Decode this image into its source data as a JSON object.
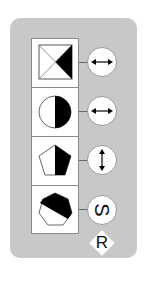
{
  "panel": {
    "background": "#c8c8c8",
    "rows": [
      {
        "shape": "square-with-diagonals",
        "shape_icon": "square-x-icon",
        "fill": "right-triangle-black",
        "control": "horizontal-double-arrow",
        "control_icon": "arrow-left-right-icon"
      },
      {
        "shape": "circle",
        "shape_icon": "half-circle-icon",
        "fill": "right-half-black",
        "control": "horizontal-double-arrow",
        "control_icon": "arrow-left-right-icon"
      },
      {
        "shape": "pentagon",
        "shape_icon": "pentagon-icon",
        "fill": "right-half-black",
        "control": "vertical-double-arrow",
        "control_icon": "arrow-up-down-icon"
      },
      {
        "shape": "heptagon",
        "shape_icon": "heptagon-icon",
        "fill": "upper-diagonal-black",
        "control": "rotated-letter",
        "control_label": "S"
      }
    ],
    "extra_badge": {
      "label": "R",
      "shape": "diamond"
    }
  }
}
